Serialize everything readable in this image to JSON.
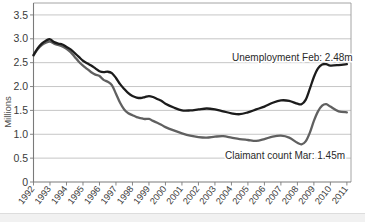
{
  "chart_data": {
    "type": "line",
    "title": "",
    "xlabel": "",
    "ylabel": "Millions",
    "ylim": [
      0,
      3.75
    ],
    "xlim": [
      1992,
      2011.25
    ],
    "grid": true,
    "legend_position": "inline-annotation",
    "yticks": [
      "0",
      "0.5",
      "1.0",
      "1.5",
      "2.0",
      "2.5",
      "3.0",
      "3.5"
    ],
    "ytick_values": [
      0,
      0.5,
      1.0,
      1.5,
      2.0,
      2.5,
      3.0,
      3.5
    ],
    "categories": [
      "1992",
      "1993",
      "1994",
      "1995",
      "1996",
      "1997",
      "1998",
      "1999",
      "2000",
      "2001",
      "2002",
      "2003",
      "2004",
      "2005",
      "2006",
      "2007",
      "2008",
      "2009",
      "2010",
      "2011"
    ],
    "x": [
      1992,
      1993,
      1994,
      1995,
      1996,
      1997,
      1998,
      1999,
      2000,
      2001,
      2002,
      2003,
      2004,
      2005,
      2006,
      2007,
      2008,
      2009,
      2010,
      2011
    ],
    "series": [
      {
        "name": "Unemployment",
        "color": "#1c1c1c",
        "width": 2.3,
        "x": [
          1992.0,
          1992.25,
          1992.5,
          1992.75,
          1993.0,
          1993.25,
          1993.5,
          1993.75,
          1994.0,
          1994.25,
          1994.5,
          1994.75,
          1995.0,
          1995.25,
          1995.5,
          1995.75,
          1996.0,
          1996.25,
          1996.5,
          1996.75,
          1997.0,
          1997.25,
          1997.5,
          1997.75,
          1998.0,
          1998.25,
          1998.5,
          1998.75,
          1999.0,
          1999.25,
          1999.5,
          1999.75,
          2000.0,
          2000.5,
          2001.0,
          2001.5,
          2002.0,
          2002.5,
          2003.0,
          2003.5,
          2004.0,
          2004.5,
          2005.0,
          2005.5,
          2006.0,
          2006.5,
          2007.0,
          2007.5,
          2008.0,
          2008.25,
          2008.5,
          2008.75,
          2009.0,
          2009.25,
          2009.5,
          2009.75,
          2010.0,
          2010.5,
          2011.0
        ],
        "values": [
          2.66,
          2.8,
          2.9,
          2.96,
          2.99,
          2.93,
          2.9,
          2.88,
          2.83,
          2.78,
          2.7,
          2.62,
          2.54,
          2.49,
          2.44,
          2.38,
          2.32,
          2.3,
          2.31,
          2.28,
          2.18,
          2.05,
          1.95,
          1.86,
          1.8,
          1.77,
          1.76,
          1.78,
          1.8,
          1.78,
          1.74,
          1.7,
          1.64,
          1.56,
          1.5,
          1.5,
          1.52,
          1.54,
          1.52,
          1.48,
          1.44,
          1.42,
          1.46,
          1.52,
          1.58,
          1.66,
          1.71,
          1.7,
          1.64,
          1.63,
          1.72,
          1.95,
          2.2,
          2.38,
          2.46,
          2.47,
          2.44,
          2.45,
          2.47
        ],
        "end_value": 2.48,
        "end_label": "Unemployment Feb: 2.48m"
      },
      {
        "name": "Claimant count",
        "color": "#606060",
        "width": 2.3,
        "x": [
          1992.0,
          1992.25,
          1992.5,
          1992.75,
          1993.0,
          1993.25,
          1993.5,
          1993.75,
          1994.0,
          1994.25,
          1994.5,
          1994.75,
          1995.0,
          1995.25,
          1995.5,
          1995.75,
          1996.0,
          1996.25,
          1996.5,
          1996.75,
          1997.0,
          1997.25,
          1997.5,
          1997.75,
          1998.0,
          1998.25,
          1998.5,
          1998.75,
          1999.0,
          1999.25,
          1999.5,
          1999.75,
          2000.0,
          2000.5,
          2001.0,
          2001.5,
          2002.0,
          2002.5,
          2003.0,
          2003.5,
          2004.0,
          2004.5,
          2005.0,
          2005.5,
          2006.0,
          2006.5,
          2007.0,
          2007.5,
          2008.0,
          2008.25,
          2008.5,
          2008.75,
          2009.0,
          2009.25,
          2009.5,
          2009.75,
          2010.0,
          2010.5,
          2011.0
        ],
        "values": [
          2.65,
          2.78,
          2.87,
          2.92,
          2.94,
          2.9,
          2.87,
          2.84,
          2.79,
          2.72,
          2.62,
          2.52,
          2.44,
          2.37,
          2.3,
          2.25,
          2.22,
          2.14,
          2.1,
          2.03,
          1.85,
          1.66,
          1.52,
          1.44,
          1.4,
          1.36,
          1.34,
          1.32,
          1.32,
          1.28,
          1.24,
          1.2,
          1.15,
          1.08,
          1.02,
          0.97,
          0.94,
          0.93,
          0.95,
          0.96,
          0.93,
          0.9,
          0.88,
          0.86,
          0.9,
          0.95,
          0.97,
          0.93,
          0.82,
          0.79,
          0.85,
          1.03,
          1.28,
          1.48,
          1.6,
          1.63,
          1.58,
          1.48,
          1.46
        ],
        "end_value": 1.45,
        "end_label": "Claimant count Mar: 1.45m"
      }
    ],
    "annotations": [
      {
        "id": "unemployment-annotation",
        "text": "Unemployment Feb: 2.48m",
        "x_px": 232,
        "y_px": 61
      },
      {
        "id": "claimant-annotation",
        "text": "Claimant count Mar: 1.45m",
        "x_px": 225,
        "y_px": 159
      }
    ]
  },
  "axes": {
    "y_axis_title": "Millions",
    "y_tick_labels": [
      "3.5",
      "3.0",
      "2.5",
      "2.0",
      "1.5",
      "1.0",
      "0.5",
      "0"
    ],
    "x_tick_labels": [
      "1992",
      "1993",
      "1994",
      "1995",
      "1996",
      "1997",
      "1998",
      "1999",
      "2000",
      "2001",
      "2002",
      "2003",
      "2004",
      "2005",
      "2006",
      "2007",
      "2008",
      "2009",
      "2010",
      "2011"
    ]
  },
  "colors": {
    "unemployment_line": "#1c1c1c",
    "claimant_line": "#606060",
    "gridline": "#b8b8b8",
    "axis": "#7a7a7a",
    "background": "#ffffff",
    "footer_strip": "#f1f1f1"
  }
}
